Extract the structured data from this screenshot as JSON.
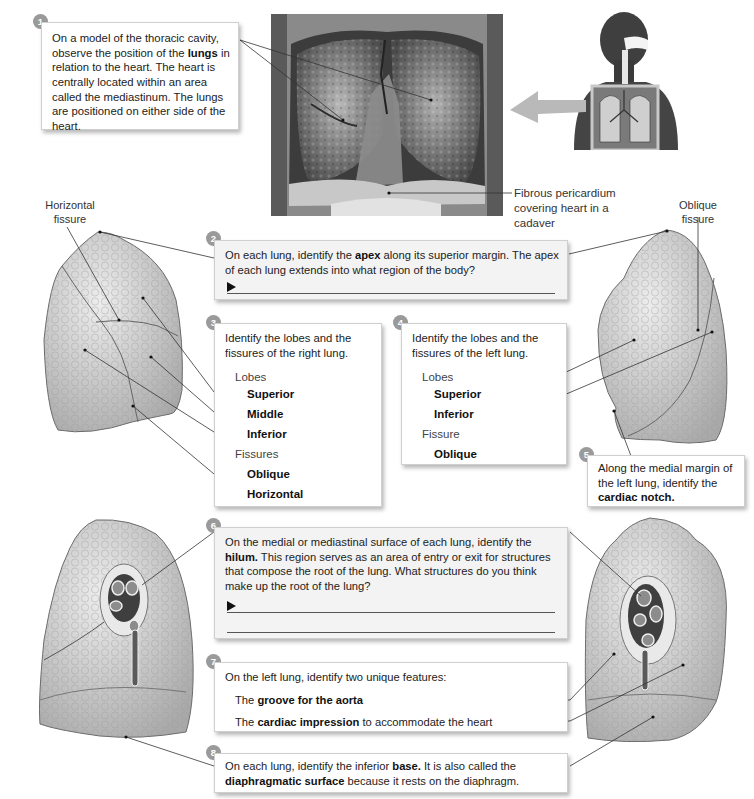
{
  "steps": {
    "s1": {
      "number": "1",
      "before": "On a model of the thoracic cavity, observe the position of the ",
      "bold": "lungs",
      "after": " in relation to the heart. The heart is centrally located within an area called the mediastinum. The lungs are positioned on either side of the heart."
    },
    "s2": {
      "number": "2",
      "before": "On each lung, identify the ",
      "bold": "apex",
      "after": " along its superior margin. The apex of each lung extends into what region of the body?",
      "answer_marker": "►"
    },
    "s3": {
      "number": "3",
      "intro": "Identify the lobes and the fissures of the right lung.",
      "lobes_heading": "Lobes",
      "lobes": [
        "Superior",
        "Middle",
        "Inferior"
      ],
      "fissures_heading": "Fissures",
      "fissures": [
        "Oblique",
        "Horizontal"
      ]
    },
    "s4": {
      "number": "4",
      "intro": "Identify the lobes and the fissures of the left lung.",
      "lobes_heading": "Lobes",
      "lobes": [
        "Superior",
        "Inferior"
      ],
      "fissure_heading": "Fissure",
      "fissures": [
        "Oblique"
      ]
    },
    "s5": {
      "number": "5",
      "before": "Along the medial margin of the left lung, identify the ",
      "bold": "cardiac notch."
    },
    "s6": {
      "number": "6",
      "before": "On the medial or mediastinal surface of each lung, identify the ",
      "bold": "hilum.",
      "after": " This region serves as an area of entry or exit for structures that compose the root of the lung. What structures do you think make up the root of the lung?",
      "answer_marker": "►"
    },
    "s7": {
      "number": "7",
      "intro": "On the left lung, identify two unique features:",
      "item1_pre": "The ",
      "item1_bold": "groove for the aorta",
      "item2_pre": "The ",
      "item2_bold": "cardiac impression",
      "item2_post": " to accommodate the heart"
    },
    "s8": {
      "number": "8",
      "before": "On each lung, identify the inferior ",
      "bold1": "base.",
      "middle": " It is also called the ",
      "bold2": "diaphragmatic surface",
      "after": " because it rests on the diaphragm."
    }
  },
  "labels": {
    "fibrous_pericardium": "Fibrous pericardium covering heart in a cadaver",
    "horizontal_fissure": "Horizontal fissure",
    "oblique_fissure": "Oblique fissure"
  },
  "figures": {
    "cadaver_photo": "thoracic-cavity-cadaver-photo",
    "body_inset": "human-torso-respiratory-inset",
    "right_lung_lateral": "right-lung-lateral-view",
    "left_lung_lateral": "left-lung-lateral-view",
    "right_lung_medial": "right-lung-medial-view",
    "left_lung_medial": "left-lung-medial-view"
  },
  "colors": {
    "badge": "#9a9a9a",
    "lung_fill": "#d8d8d8",
    "lung_edge": "#6a6a6a",
    "arrow": "#b9b9b9"
  }
}
